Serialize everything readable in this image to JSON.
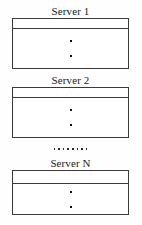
{
  "diagram": {
    "background_color": "#fefefe",
    "line_color": "#3a3a3a",
    "text_color": "#1a1a1a",
    "servers": [
      {
        "label": "Server 1",
        "label_top": 5,
        "box_top": 21,
        "box_height": 51,
        "header_height": 10,
        "dot_count": 2
      },
      {
        "label": "Server 2",
        "label_top": 74,
        "box_top": 89,
        "box_height": 51,
        "header_height": 10,
        "dot_count": 2
      },
      {
        "label": "Server N",
        "label_top": 157,
        "box_top": 173,
        "box_height": 45,
        "header_height": 13,
        "dot_count": 2
      }
    ],
    "ellipsis": {
      "dots": 8,
      "top": 148
    }
  }
}
